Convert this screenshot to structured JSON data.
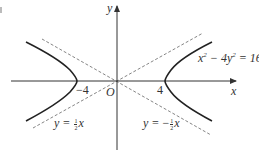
{
  "figure": {
    "type": "hyperbola-with-asymptotes",
    "equation": "x² − 4y² = 16",
    "axes": {
      "x_label": "x",
      "y_label": "y",
      "origin_label": "O"
    },
    "ticks": {
      "left_vertex": "−4",
      "right_vertex": "4"
    },
    "asymptotes": [
      {
        "label_prefix": "y = ",
        "sign": "",
        "num": "1",
        "den": "2",
        "var": "x"
      },
      {
        "label_prefix": "y = ",
        "sign": "−",
        "num": "1",
        "den": "2",
        "var": "x"
      }
    ],
    "colors": {
      "curve": "#222222",
      "axis": "#333333",
      "asymptote": "#666666",
      "background": "#ffffff"
    }
  }
}
